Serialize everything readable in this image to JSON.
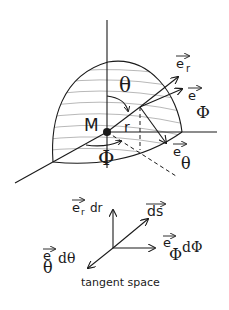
{
  "diagram": {
    "sphere": {
      "origin_label": "M",
      "radius_label": "r",
      "polar_angle_label": "θ",
      "azimuth_angle_label": "Φ",
      "basis_vectors": {
        "e_r": {
          "base": "e",
          "sub": "r"
        },
        "e_phi": {
          "base": "e",
          "sub": "Φ"
        },
        "e_theta": {
          "base": "e",
          "sub": "θ"
        }
      }
    },
    "tangent_space": {
      "caption": "tangent space",
      "e_r_dr": {
        "base": "e",
        "sub": "r",
        "tail": "dr"
      },
      "ds": {
        "base": "ds"
      },
      "e_phi_dphi": {
        "base": "e",
        "sub": "Φ",
        "tail": "dΦ"
      },
      "e_theta_dtheta": {
        "base": "e",
        "sub": "θ",
        "tail": "dθ"
      }
    }
  }
}
